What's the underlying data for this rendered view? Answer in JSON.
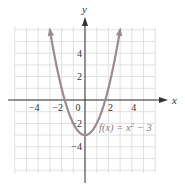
{
  "chart_data": {
    "type": "line",
    "title": "",
    "function_label": "f(x) = x² − 3",
    "function_label_parts": {
      "lhs": "f(x) = x",
      "exp": "2",
      "rhs": " − 3"
    },
    "xlabel": "x",
    "ylabel": "y",
    "xlim": [
      -6,
      6
    ],
    "ylim": [
      -6,
      6
    ],
    "grid": true,
    "x_ticks": [
      -4,
      -2,
      0,
      2,
      4
    ],
    "y_ticks": [
      4,
      2,
      -2,
      -4
    ],
    "x_tick_labels": [
      "−4",
      "−2",
      "0",
      "2",
      "4"
    ],
    "y_tick_labels": [
      "4",
      "2",
      "−2",
      "−4"
    ],
    "series": [
      {
        "name": "f(x) = x^2 - 3",
        "x": [
          -3,
          -2.5,
          -2,
          -1.5,
          -1,
          -0.5,
          0,
          0.5,
          1,
          1.5,
          2,
          2.5,
          3
        ],
        "values": [
          6,
          3.25,
          1,
          -0.75,
          -2,
          -2.75,
          -3,
          -2.75,
          -2,
          -0.75,
          1,
          3.25,
          6
        ]
      }
    ],
    "colors": {
      "curve": "#9a8a94",
      "grid": "#d9d9d9",
      "axis": "#333333"
    }
  }
}
